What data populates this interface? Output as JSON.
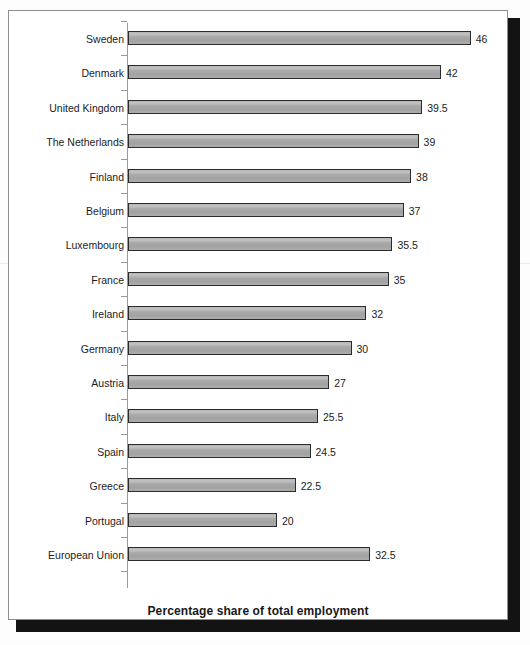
{
  "figure": {
    "axis_title": "Percentage share of total employment",
    "frame_color": "#8d8d8d",
    "shadow_color": "#131313",
    "bar_fill": "#a9a9a9",
    "bar_border": "#2b2b2b",
    "axis_color": "#9a9a9a",
    "text_color": "#1c1c1c"
  },
  "chart_data": {
    "type": "bar",
    "orientation": "horizontal",
    "title": "",
    "subtitle": "",
    "xlabel": "Percentage share of total employment",
    "ylabel": "",
    "xlim": [
      0,
      50
    ],
    "grid": false,
    "legend": null,
    "categories": [
      "Sweden",
      "Denmark",
      "United Kingdom",
      "The Netherlands",
      "Finland",
      "Belgium",
      "Luxembourg",
      "France",
      "Ireland",
      "Germany",
      "Austria",
      "Italy",
      "Spain",
      "Greece",
      "Portugal",
      "European Union"
    ],
    "values": [
      46,
      42,
      39.5,
      39,
      38,
      37,
      35.5,
      35,
      32,
      30,
      27,
      25.5,
      24.5,
      22.5,
      20,
      32.5
    ],
    "value_labels": [
      "46",
      "42",
      "39.5",
      "39",
      "38",
      "37",
      "35.5",
      "35",
      "32",
      "30",
      "27",
      "25.5",
      "24.5",
      "22.5",
      "20",
      "32.5"
    ]
  }
}
